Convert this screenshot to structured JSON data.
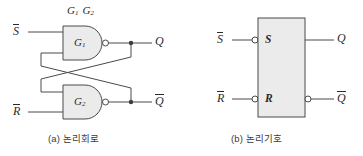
{
  "figure": {
    "title_labels": {
      "gate_group": "G",
      "gate_group_sub1": "1",
      "gate_group_sub2": "2"
    },
    "panel_a": {
      "caption": "(a) 논리회로",
      "gates": [
        {
          "name": "G",
          "sub": "1",
          "type": "NAND"
        },
        {
          "name": "G",
          "sub": "2",
          "type": "NAND"
        }
      ],
      "inputs": [
        {
          "label": "S",
          "overbar": true
        },
        {
          "label": "R",
          "overbar": true
        }
      ],
      "outputs": [
        {
          "label": "Q",
          "overbar": false
        },
        {
          "label": "Q",
          "overbar": true
        }
      ]
    },
    "panel_b": {
      "caption": "(b) 논리기호",
      "block_inputs": [
        {
          "external_label": "S",
          "external_overbar": true,
          "pin_label": "S",
          "bubble": true
        },
        {
          "external_label": "R",
          "external_overbar": true,
          "pin_label": "R",
          "bubble": true
        }
      ],
      "block_outputs": [
        {
          "label": "Q",
          "overbar": false,
          "bubble": false
        },
        {
          "label": "Q",
          "overbar": true,
          "bubble": true
        }
      ]
    },
    "colors": {
      "stroke": "#4a4a4a",
      "fill": "#ebebeb",
      "text": "#2b2b2b",
      "caption": "#3a3a3a",
      "background": "#ffffff"
    }
  }
}
